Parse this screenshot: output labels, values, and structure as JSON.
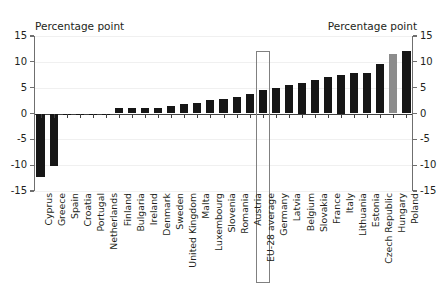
{
  "axes": {
    "left_title": "Percentage point",
    "right_title": "Percentage point",
    "tick_labels": [
      "15",
      "10",
      "5",
      "0",
      "-5",
      "-10",
      "-15"
    ]
  },
  "highlight": {
    "category": "EU-28 average",
    "outline_color": "#808080"
  },
  "colors": {
    "bar": "#161616",
    "bar_highlight": "#8c8c8c",
    "grid": "#f0f0f0",
    "axis": "#6f6f6f",
    "text": "#231f20"
  },
  "chart_data": {
    "type": "bar",
    "title": "",
    "subtitle": "",
    "xlabel": "",
    "ylabel": "Percentage point",
    "ylim": [
      -15,
      15
    ],
    "yticks": [
      15,
      10,
      5,
      0,
      -5,
      -10,
      -15
    ],
    "grid": true,
    "legend": "none",
    "categories": [
      "Cyprus",
      "Greece",
      "Spain",
      "Croatia",
      "Portugal",
      "Netherlands",
      "Finland",
      "Bulgaria",
      "Ireland",
      "Denmark",
      "Sweden",
      "United Kingdom",
      "Malta",
      "Luxembourg",
      "Slovenia",
      "Romania",
      "Austria",
      "EU-28 average",
      "Germany",
      "Latvia",
      "Belgium",
      "Slovakia",
      "France",
      "Italy",
      "Lithuania",
      "Estonia",
      "Czech Republic",
      "Hungary",
      "Poland"
    ],
    "values": [
      -12.3,
      -10.1,
      -0.3,
      -0.2,
      -0.2,
      -0.1,
      1.0,
      1.1,
      1.1,
      1.1,
      1.4,
      1.8,
      2.0,
      2.7,
      2.8,
      3.2,
      3.7,
      4.6,
      4.9,
      5.6,
      6.0,
      6.5,
      7.1,
      7.5,
      7.8,
      7.9,
      9.5,
      11.6,
      12.1
    ],
    "bar_colors": [
      "#161616",
      "#161616",
      "#161616",
      "#161616",
      "#161616",
      "#161616",
      "#161616",
      "#161616",
      "#161616",
      "#161616",
      "#161616",
      "#161616",
      "#161616",
      "#161616",
      "#161616",
      "#161616",
      "#161616",
      "#161616",
      "#161616",
      "#161616",
      "#161616",
      "#161616",
      "#161616",
      "#161616",
      "#161616",
      "#161616",
      "#161616",
      "#8c8c8c",
      "#161616"
    ]
  }
}
